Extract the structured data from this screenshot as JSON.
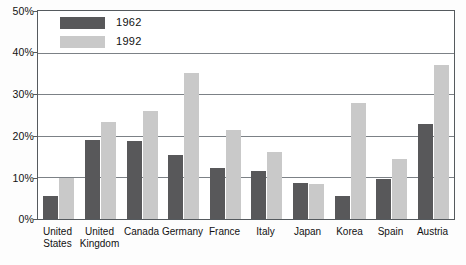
{
  "chart_data": {
    "type": "bar",
    "title": "",
    "xlabel": "",
    "ylabel": "",
    "ylim": [
      0,
      50
    ],
    "ytick_labels": [
      "0%",
      "10%",
      "20%",
      "30%",
      "40%",
      "50%"
    ],
    "ytick_values": [
      0,
      10,
      20,
      30,
      40,
      50
    ],
    "grid": true,
    "legend_position": "top-left",
    "categories": [
      "United States",
      "United Kingdom",
      "Canada",
      "Germany",
      "France",
      "Italy",
      "Japan",
      "Korea",
      "Spain",
      "Austria"
    ],
    "category_lines": [
      [
        "United",
        "States"
      ],
      [
        "United",
        "Kingdom"
      ],
      [
        "Canada",
        ""
      ],
      [
        "Germany",
        ""
      ],
      [
        "France",
        ""
      ],
      [
        "Italy",
        ""
      ],
      [
        "Japan",
        ""
      ],
      [
        "Korea",
        ""
      ],
      [
        "Spain",
        ""
      ],
      [
        "Austria",
        ""
      ]
    ],
    "series": [
      {
        "name": "1962",
        "color": "#58585a",
        "values": [
          5.5,
          19.0,
          18.7,
          15.5,
          12.2,
          11.5,
          8.7,
          5.5,
          9.5,
          22.8
        ]
      },
      {
        "name": "1992",
        "color": "#c9c9c9",
        "values": [
          9.8,
          23.2,
          26.0,
          35.0,
          21.3,
          16.1,
          8.5,
          28.0,
          14.5,
          37.0
        ]
      }
    ]
  },
  "legend": {
    "items": [
      {
        "label": "1962",
        "color": "#58585a"
      },
      {
        "label": "1992",
        "color": "#c9c9c9"
      }
    ]
  },
  "axis": {
    "y": {
      "ticks": [
        "50%",
        "40%",
        "30%",
        "20%",
        "10%",
        "0%"
      ]
    }
  }
}
